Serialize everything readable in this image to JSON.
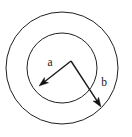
{
  "figure": {
    "name": "concentric-circles-radii",
    "background_color": "#ffffff",
    "stroke_color": "#221f1f",
    "label_color": "#1a1a1a"
  },
  "labels": {
    "inner_radius": "a",
    "outer_radius": "b"
  },
  "chart_data": {
    "type": "diagram",
    "title": "",
    "shapes": [
      {
        "kind": "circle",
        "name": "outer-circle",
        "cx": 62,
        "cy": 68,
        "r": 56,
        "fill": "none",
        "stroke": "#221f1f"
      },
      {
        "kind": "circle",
        "name": "inner-circle",
        "cx": 62,
        "cy": 68,
        "r": 35,
        "fill": "none",
        "stroke": "#221f1f"
      },
      {
        "kind": "arrow",
        "name": "radius-arrow-a",
        "label": "a",
        "from": [
          71,
          61
        ],
        "to": [
          39,
          86
        ],
        "label_position": [
          50,
          66
        ]
      },
      {
        "kind": "arrow",
        "name": "radius-arrow-b",
        "label": "b",
        "from": [
          71,
          61
        ],
        "to": [
          101,
          107
        ],
        "label_position": [
          104,
          86
        ]
      }
    ]
  }
}
